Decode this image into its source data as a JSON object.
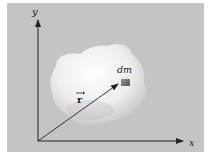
{
  "figure": {
    "axis_labels": {
      "x": "x",
      "y": "y"
    },
    "vector_label": "r",
    "element_label": "dm",
    "colors": {
      "background": "#c4c4c4",
      "axis": "#222222",
      "body": "#f2f2f2"
    }
  }
}
